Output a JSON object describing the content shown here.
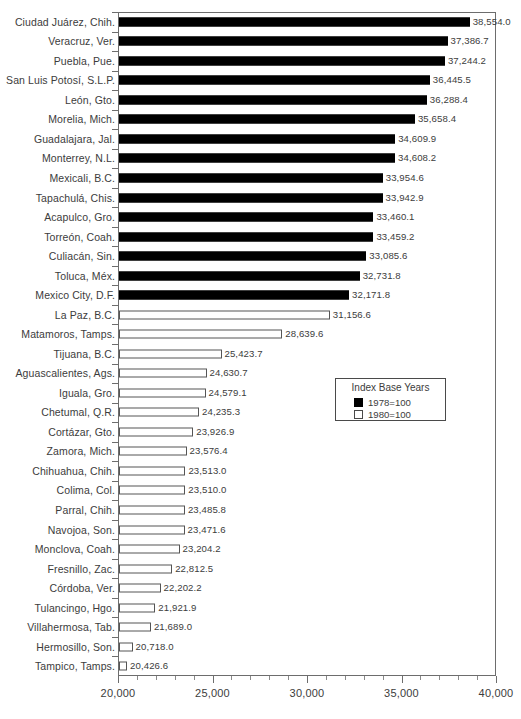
{
  "chart_data": {
    "type": "bar",
    "orientation": "horizontal",
    "title": "",
    "xlabel": "",
    "ylabel": "",
    "xlim": [
      20000,
      40000
    ],
    "xticks": [
      "20,000",
      "25,000",
      "30,000",
      "35,000",
      "40,000"
    ],
    "xtick_values": [
      20000,
      25000,
      30000,
      35000,
      40000
    ],
    "minor_tick_step": 1000,
    "grid": false,
    "legend": {
      "title": "Index Base Years",
      "position": "middle-right",
      "entries": [
        {
          "label": "1978=100",
          "swatch": "black",
          "color": "#000000"
        },
        {
          "label": "1980=100",
          "swatch": "white",
          "color": "#ffffff"
        }
      ]
    },
    "categories": [
      "Ciudad Juárez, Chih.",
      "Veracruz, Ver.",
      "Puebla, Pue.",
      "San Luis Potosí, S.L.P.",
      "León, Gto.",
      "Morelia, Mich.",
      "Guadalajara, Jal.",
      "Monterrey, N.L.",
      "Mexicali, B.C.",
      "Tapachulá, Chis.",
      "Acapulco, Gro.",
      "Torreón, Coah.",
      "Culiacán, Sin.",
      "Toluca, Méx.",
      "Mexico City, D.F.",
      "La Paz, B.C.",
      "Matamoros, Tamps.",
      "Tijuana, B.C.",
      "Aguascalientes, Ags.",
      "Iguala, Gro.",
      "Chetumal, Q.R.",
      "Cortázar, Gto.",
      "Zamora, Mich.",
      "Chihuahua, Chih.",
      "Colima, Col.",
      "Parral, Chih.",
      "Navojoa, Son.",
      "Monclova, Coah.",
      "Fresnillo, Zac.",
      "Córdoba, Ver.",
      "Tulancingo, Hgo.",
      "Villahermosa, Tab.",
      "Hermosillo, Son.",
      "Tampico, Tamps."
    ],
    "values": [
      38554.0,
      37386.7,
      37244.2,
      36445.5,
      36288.4,
      35658.4,
      34609.9,
      34608.2,
      33954.6,
      33942.9,
      33460.1,
      33459.2,
      33085.6,
      32731.8,
      32171.8,
      31156.6,
      28639.6,
      25423.7,
      24630.7,
      24579.1,
      24235.3,
      23926.9,
      23576.4,
      23513.0,
      23510.0,
      23485.8,
      23471.6,
      23204.2,
      22812.5,
      22202.2,
      21921.9,
      21689.0,
      20718.0,
      20426.6
    ],
    "value_labels": [
      "38,554.0",
      "37,386.7",
      "37,244.2",
      "36,445.5",
      "36,288.4",
      "35,658.4",
      "34,609.9",
      "34,608.2",
      "33,954.6",
      "33,942.9",
      "33,460.1",
      "33,459.2",
      "33,085.6",
      "32,731.8",
      "32,171.8",
      "31,156.6",
      "28,639.6",
      "25,423.7",
      "24,630.7",
      "24,579.1",
      "24,235.3",
      "23,926.9",
      "23,576.4",
      "23,513.0",
      "23,510.0",
      "23,485.8",
      "23,471.6",
      "23,204.2",
      "22,812.5",
      "22,202.2",
      "21,921.9",
      "21,689.0",
      "20,718.0",
      "20,426.6"
    ],
    "series_of_point": [
      "1978=100",
      "1978=100",
      "1978=100",
      "1978=100",
      "1978=100",
      "1978=100",
      "1978=100",
      "1978=100",
      "1978=100",
      "1978=100",
      "1978=100",
      "1978=100",
      "1978=100",
      "1978=100",
      "1978=100",
      "1980=100",
      "1980=100",
      "1980=100",
      "1980=100",
      "1980=100",
      "1980=100",
      "1980=100",
      "1980=100",
      "1980=100",
      "1980=100",
      "1980=100",
      "1980=100",
      "1980=100",
      "1980=100",
      "1980=100",
      "1980=100",
      "1980=100",
      "1980=100",
      "1980=100"
    ]
  },
  "colors": {
    "series_1978": "#000000",
    "series_1980": "#ffffff",
    "bar_outline": "#555555",
    "axis": "#6d6d6d",
    "text": "#3c3c3c",
    "background": "#ffffff"
  }
}
